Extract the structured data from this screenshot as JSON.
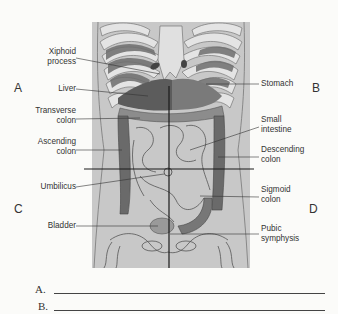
{
  "diagram": {
    "quadrant_letters": [
      "A",
      "B",
      "C",
      "D"
    ],
    "labels_left": [
      {
        "text1": "Xiphoid",
        "text2": "process"
      },
      {
        "text1": "Liver",
        "text2": ""
      },
      {
        "text1": "Transverse",
        "text2": "colon"
      },
      {
        "text1": "Ascending",
        "text2": "colon"
      },
      {
        "text1": "Umbilicus",
        "text2": ""
      },
      {
        "text1": "Bladder",
        "text2": ""
      }
    ],
    "labels_right": [
      {
        "text1": "Stomach",
        "text2": ""
      },
      {
        "text1": "Small",
        "text2": "intestine"
      },
      {
        "text1": "Descending",
        "text2": "colon"
      },
      {
        "text1": "Sigmoid",
        "text2": "colon"
      },
      {
        "text1": "Pubic",
        "text2": "symphysis"
      }
    ],
    "colors": {
      "body": "#c9c9c9",
      "ribs": "#e2e2e2",
      "intercostal": "#6e6e6e",
      "organ_dark": "#5a5a5a",
      "organ_mid": "#8a8a8a",
      "line": "#1a1a1a"
    }
  },
  "answers": [
    {
      "label": "A."
    },
    {
      "label": "B."
    }
  ]
}
